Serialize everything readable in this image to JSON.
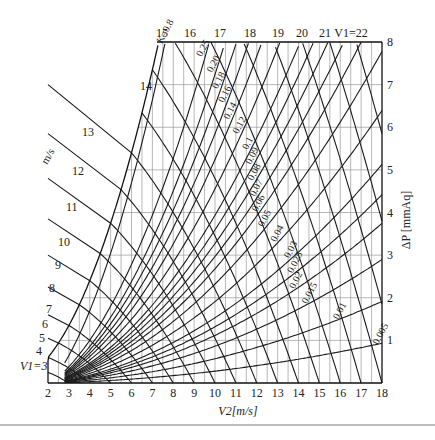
{
  "chart_data": {
    "type": "line",
    "title": "",
    "xlabel": "V2[m/s]",
    "ylabel": "ΔP [mmAq]",
    "left_axis_label": "m/s",
    "xlim": [
      2,
      18
    ],
    "ylim": [
      0,
      8
    ],
    "x_ticks": [
      2,
      3,
      4,
      5,
      6,
      7,
      8,
      9,
      10,
      11,
      12,
      13,
      14,
      15,
      16,
      17,
      18
    ],
    "y_ticks": [
      1,
      2,
      3,
      4,
      5,
      6,
      7,
      8
    ],
    "grid": {
      "vertical_step": 0.5,
      "horizontal_step": 1
    },
    "v1_series": {
      "name": "V1 (m/s)",
      "values": [
        3,
        4,
        5,
        6,
        7,
        8,
        9,
        10,
        11,
        12,
        13,
        14,
        15,
        16,
        17,
        18,
        19,
        20,
        21,
        22
      ],
      "labels_left": [
        "V1=3",
        "4",
        "5",
        "6",
        "7",
        "8",
        "9",
        "10",
        "11",
        "12",
        "13",
        "14"
      ],
      "labels_top": [
        "15",
        "16",
        "17",
        "18",
        "19",
        "20",
        "21",
        "V1=22"
      ]
    },
    "k_series": {
      "name": "K",
      "values": [
        0.8,
        0.25,
        0.2,
        0.18,
        0.16,
        0.14,
        0.12,
        0.1,
        0.09,
        0.08,
        0.07,
        0.06,
        0.05,
        0.04,
        0.03,
        0.025,
        0.02,
        0.015,
        0.01,
        0.005
      ],
      "labels": [
        "K=0.8",
        "0.25",
        "0.20",
        "0.18",
        "0.16",
        "0.14",
        "0.12",
        "0.1",
        "0.09",
        "0.08",
        "0.07",
        "0.06",
        "0.05",
        "0.04",
        "0.03",
        "0.025",
        "0.02",
        "0.015",
        "0.01",
        "0.005"
      ],
      "ratio_v2_v1": [
        0.5,
        0.6,
        0.63,
        0.65,
        0.67,
        0.69,
        0.715,
        0.74,
        0.755,
        0.77,
        0.785,
        0.8,
        0.82,
        0.845,
        0.87,
        0.885,
        0.9,
        0.92,
        0.945,
        0.972
      ]
    },
    "model": "ΔP ≈ 0.05·(V1² − V2²)"
  },
  "labels": {
    "x_axis_title": "V2[m/s]",
    "y_axis_title": "ΔP [mmAq]",
    "left_unit": "m/s"
  }
}
